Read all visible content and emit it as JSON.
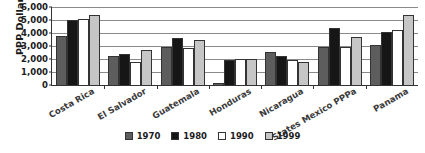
{
  "chart_data": {
    "type": "bar",
    "title": "",
    "xlabel": "",
    "ylabel": "PPP Dollars",
    "ylim": [
      0,
      6000
    ],
    "ytick_step": 1000,
    "yticks": [
      "0",
      "1,000",
      "2,000",
      "3,000",
      "4,000",
      "5,000",
      "6,000"
    ],
    "grid": true,
    "legend_position": "bottom",
    "categories": [
      "Costa Rica",
      "El Salvador",
      "Guatemala",
      "Honduras",
      "Nicaragua",
      "States Mexico PPPa",
      "Panama"
    ],
    "series": [
      {
        "name": "1970",
        "color": "#5d5d5d",
        "values": [
          3750,
          2250,
          2950,
          150,
          2550,
          2900,
          3050
        ]
      },
      {
        "name": "1980",
        "color": "#161616",
        "values": [
          5000,
          2400,
          3650,
          1900,
          2200,
          4400,
          4050
        ]
      },
      {
        "name": "1990",
        "color": "#ffffff",
        "values": [
          5050,
          1800,
          2850,
          2000,
          1900,
          2950,
          4250
        ]
      },
      {
        "name": "1999",
        "color": "#c6c6c6",
        "values": [
          5400,
          2700,
          3450,
          2000,
          1750,
          3700,
          5400
        ]
      }
    ]
  },
  "legend": {
    "items": [
      {
        "label": "1970"
      },
      {
        "label": "1980"
      },
      {
        "label": "1990"
      },
      {
        "label": "1999"
      }
    ]
  }
}
